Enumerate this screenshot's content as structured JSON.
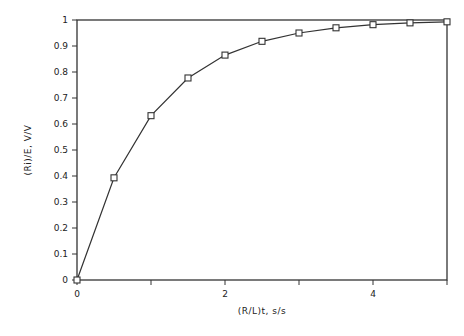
{
  "chart_data": {
    "type": "line",
    "title": "",
    "xlabel": "(R/L)t, s/s",
    "ylabel": "(Ri)/E, V/V",
    "xlim": [
      0,
      5
    ],
    "ylim": [
      0,
      1
    ],
    "x_ticks": [
      0,
      1,
      2,
      3,
      4,
      5
    ],
    "x_tick_labels": [
      "0",
      "",
      "2",
      "",
      "4",
      ""
    ],
    "y_ticks": [
      0,
      0.1,
      0.2,
      0.3,
      0.4,
      0.5,
      0.6,
      0.7,
      0.8,
      0.9,
      1
    ],
    "y_tick_labels": [
      "0",
      "0.1",
      "0.2",
      "0.3",
      "0.4",
      "0.5",
      "0.6",
      "0.7",
      "0.8",
      "0.9",
      "1"
    ],
    "grid": false,
    "legend": null,
    "series": [
      {
        "name": "response",
        "marker": "square",
        "color": "#333333",
        "x": [
          0,
          0.5,
          1,
          1.5,
          2,
          2.5,
          3,
          3.5,
          4,
          4.5,
          5
        ],
        "y": [
          0,
          0.393,
          0.632,
          0.777,
          0.865,
          0.918,
          0.95,
          0.97,
          0.982,
          0.989,
          0.993
        ]
      }
    ]
  },
  "frame": {
    "left": 77,
    "right": 447,
    "top": 20,
    "bottom": 280
  }
}
